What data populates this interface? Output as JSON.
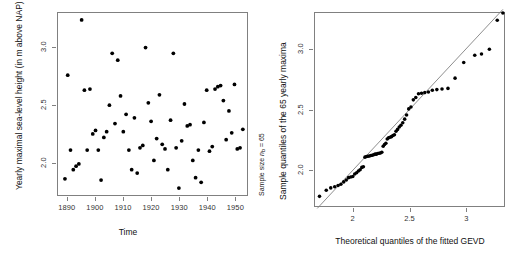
{
  "figure": {
    "background": "#ffffff",
    "axis_color": "#808080",
    "point_color": "#000000",
    "line_color": "#808080"
  },
  "panels": {
    "left": {
      "name": "yearly-maxima-time-series",
      "xlabel": "Time",
      "ylabel": "Yearly maximal sea-level height (in m above NAP)",
      "side_note_prefix": "Sample size ",
      "side_note_symbol": "n",
      "side_note_subscript": "b",
      "side_note_suffix": " = 65",
      "xticks": [
        "1890",
        "1900",
        "1910",
        "1920",
        "1930",
        "1940",
        "1950"
      ],
      "yticks": [
        "2.0",
        "2.5",
        "3.0"
      ]
    },
    "right": {
      "name": "gevd-qq-plot",
      "xlabel": "Theoretical quantiles of the fitted GEVD",
      "ylabel": "Sample quantiles of the 65 yearly maxima",
      "xticks": [
        "2.0",
        "2.5",
        "3.0"
      ],
      "yticks": [
        "2.0",
        "2.5",
        "3.0"
      ]
    }
  },
  "chart_data": [
    {
      "type": "scatter",
      "name": "yearly-maxima-scatter",
      "title": "",
      "xlabel": "Time",
      "ylabel": "Yearly maximal sea-level height (in m above NAP)",
      "annotation": "Sample size n_b = 65",
      "sample_size": 65,
      "xlim": [
        1886.5,
        1954.5
      ],
      "ylim": [
        1.72,
        3.3
      ],
      "xticks": [
        1890,
        1900,
        1910,
        1920,
        1930,
        1940,
        1950
      ],
      "yticks": [
        2.0,
        2.5,
        3.0
      ],
      "grid": false,
      "legend": "none",
      "x": [
        1889,
        1890,
        1891,
        1892,
        1893,
        1894,
        1895,
        1896,
        1897,
        1898,
        1899,
        1900,
        1901,
        1902,
        1903,
        1904,
        1905,
        1906,
        1907,
        1908,
        1909,
        1910,
        1911,
        1912,
        1913,
        1914,
        1915,
        1916,
        1917,
        1918,
        1919,
        1920,
        1921,
        1922,
        1923,
        1924,
        1925,
        1926,
        1927,
        1928,
        1929,
        1930,
        1931,
        1932,
        1933,
        1934,
        1935,
        1936,
        1937,
        1938,
        1939,
        1940,
        1941,
        1942,
        1943,
        1944,
        1945,
        1946,
        1947,
        1948,
        1949,
        1950,
        1951,
        1952,
        1953
      ],
      "y": [
        1.86,
        2.76,
        2.11,
        1.94,
        1.97,
        1.99,
        3.24,
        2.63,
        2.11,
        2.64,
        2.25,
        2.28,
        2.11,
        1.85,
        2.22,
        2.27,
        2.5,
        2.95,
        2.34,
        2.89,
        2.58,
        2.27,
        2.42,
        2.11,
        1.94,
        2.39,
        1.91,
        2.13,
        2.15,
        3.0,
        2.52,
        2.36,
        2.02,
        2.21,
        2.59,
        2.16,
        2.12,
        1.94,
        2.37,
        2.95,
        2.13,
        1.78,
        2.19,
        2.51,
        2.32,
        2.33,
        2.02,
        1.87,
        2.11,
        1.83,
        2.35,
        2.63,
        2.1,
        2.14,
        2.64,
        2.66,
        2.67,
        2.54,
        2.2,
        2.45,
        2.26,
        2.68,
        2.12,
        2.13,
        2.29
      ]
    },
    {
      "type": "scatter",
      "name": "qq-plot-gevd",
      "title": "",
      "xlabel": "Theoretical quantiles of the fitted GEVD",
      "ylabel": "Sample quantiles of the 65 yearly maxima",
      "sample_size": 65,
      "xlim": [
        1.66,
        3.34
      ],
      "ylim": [
        1.7,
        3.3
      ],
      "xticks": [
        2.0,
        2.5,
        3.0
      ],
      "yticks": [
        2.0,
        2.5,
        3.0
      ],
      "grid": false,
      "legend": "none",
      "reference_line": {
        "slope": 1,
        "intercept": 0,
        "x0": 1.68,
        "x1": 3.33
      },
      "x": [
        1.7,
        1.76,
        1.8,
        1.835,
        1.865,
        1.89,
        1.915,
        1.938,
        1.958,
        1.978,
        1.996,
        2.013,
        2.03,
        2.046,
        2.061,
        2.076,
        2.09,
        2.104,
        2.118,
        2.131,
        2.144,
        2.157,
        2.169,
        2.182,
        2.194,
        2.206,
        2.218,
        2.23,
        2.242,
        2.254,
        2.266,
        2.278,
        2.29,
        2.302,
        2.314,
        2.327,
        2.34,
        2.353,
        2.366,
        2.38,
        2.394,
        2.409,
        2.424,
        2.44,
        2.457,
        2.474,
        2.493,
        2.513,
        2.534,
        2.556,
        2.58,
        2.607,
        2.636,
        2.668,
        2.703,
        2.743,
        2.789,
        2.842,
        2.905,
        2.982,
        3.08,
        3.14,
        3.21,
        3.28,
        3.33
      ],
      "y": [
        1.78,
        1.83,
        1.85,
        1.86,
        1.87,
        1.88,
        1.9,
        1.915,
        1.935,
        1.94,
        1.945,
        1.965,
        1.975,
        1.99,
        2.0,
        2.02,
        2.025,
        2.105,
        2.11,
        2.112,
        2.115,
        2.118,
        2.12,
        2.125,
        2.13,
        2.13,
        2.135,
        2.138,
        2.14,
        2.145,
        2.195,
        2.21,
        2.22,
        2.255,
        2.265,
        2.27,
        2.275,
        2.285,
        2.29,
        2.32,
        2.335,
        2.355,
        2.37,
        2.39,
        2.42,
        2.455,
        2.505,
        2.52,
        2.58,
        2.6,
        2.63,
        2.635,
        2.64,
        2.645,
        2.66,
        2.665,
        2.67,
        2.675,
        2.76,
        2.89,
        2.95,
        2.96,
        3.0,
        3.24,
        3.3
      ]
    }
  ]
}
